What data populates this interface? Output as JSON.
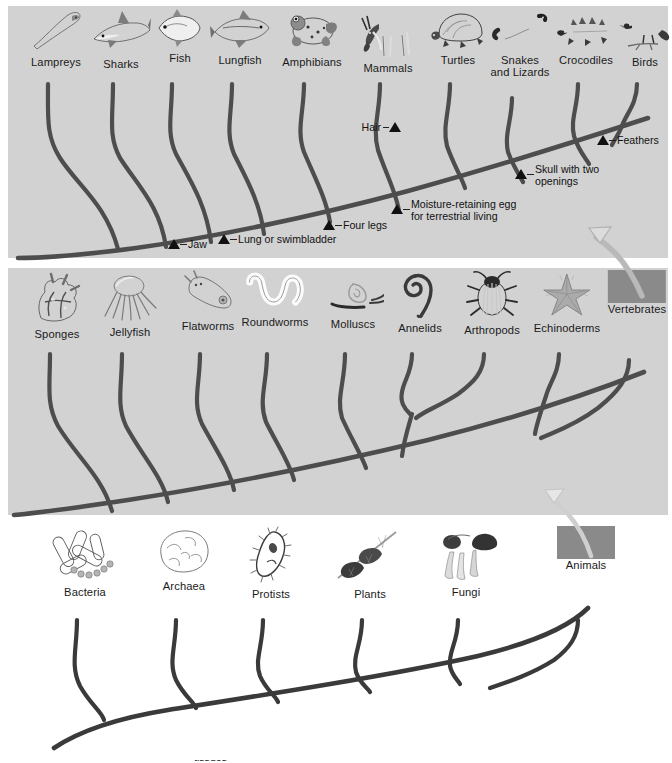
{
  "figure": {
    "colors": {
      "panel_background": "#d2d2d2",
      "page_background": "#ffffff",
      "branch": "#4d4d4d",
      "branch_dark": "#3a3a3a",
      "marker": "#111111",
      "text": "#1a1a1a",
      "placeholder_box": "#8a8a8a",
      "arrow_fill": "#d9d9d9",
      "arrow_stroke": "#9a9a9a"
    }
  },
  "panels": [
    {
      "id": "vertebrates-panel",
      "name": "vertebrate-phylogeny",
      "background": "#d2d2d2",
      "taxa": [
        {
          "label": "Lampreys",
          "icon": "lamprey-icon",
          "x": 48,
          "two_line": false
        },
        {
          "label": "Sharks",
          "icon": "shark-icon",
          "x": 113,
          "two_line": false
        },
        {
          "label": "Fish",
          "icon": "fish-icon",
          "x": 172,
          "two_line": false
        },
        {
          "label": "Lungfish",
          "icon": "lungfish-icon",
          "x": 232,
          "two_line": false
        },
        {
          "label": "Amphibians",
          "icon": "frog-icon",
          "x": 304,
          "two_line": false
        },
        {
          "label": "Mammals",
          "icon": "antelope-icon",
          "x": 380,
          "two_line": false
        },
        {
          "label": "Turtles",
          "icon": "turtle-icon",
          "x": 450,
          "two_line": false
        },
        {
          "label": "Snakes\nand Lizards",
          "icon": "snake-icon",
          "x": 512,
          "two_line": true
        },
        {
          "label": "Crocodiles",
          "icon": "crocodile-icon",
          "x": 578,
          "two_line": false
        },
        {
          "label": "Birds",
          "icon": "bird-icon",
          "x": 637,
          "two_line": false
        }
      ],
      "annotations": [
        {
          "label": "Jaw",
          "marker_x": 166,
          "marker_y": 243,
          "text_x": 180,
          "text_y": 243,
          "side": "right",
          "wrap": false,
          "width": 0
        },
        {
          "label": "Lung or swimbladder",
          "marker_x": 216,
          "marker_y": 238,
          "text_x": 230,
          "text_y": 238,
          "side": "right",
          "wrap": false,
          "width": 0
        },
        {
          "label": "Four legs",
          "marker_x": 321,
          "marker_y": 224,
          "text_x": 335,
          "text_y": 224,
          "side": "right",
          "wrap": false,
          "width": 0
        },
        {
          "label": "Moisture-retaining egg\nfor terrestrial living",
          "marker_x": 389,
          "marker_y": 208,
          "text_x": 403,
          "text_y": 202,
          "side": "right",
          "wrap": true,
          "width": 150
        },
        {
          "label": "Skull with two\nopenings",
          "marker_x": 513,
          "marker_y": 173,
          "text_x": 527,
          "text_y": 167,
          "side": "right",
          "wrap": true,
          "width": 110
        },
        {
          "label": "Feathers",
          "marker_x": 595,
          "marker_y": 139,
          "text_x": 609,
          "text_y": 139,
          "side": "right",
          "wrap": false,
          "width": 0
        },
        {
          "label": "Hair",
          "marker_x": 387,
          "marker_y": 126,
          "text_x": 373,
          "text_y": 126,
          "side": "left",
          "wrap": false,
          "width": 0
        }
      ]
    },
    {
      "id": "animals-panel",
      "name": "animal-phylogeny",
      "background": "#d2d2d2",
      "taxa": [
        {
          "label": "Sponges",
          "icon": "sponge-icon",
          "x": 49,
          "two_line": false
        },
        {
          "label": "Jellyfish",
          "icon": "jellyfish-icon",
          "x": 122,
          "two_line": false
        },
        {
          "label": "Flatworms",
          "icon": "flatworm-icon",
          "x": 200,
          "two_line": false
        },
        {
          "label": "Roundworms",
          "icon": "roundworm-icon",
          "x": 267,
          "two_line": false
        },
        {
          "label": "Molluscs",
          "icon": "snail-icon",
          "x": 345,
          "two_line": false
        },
        {
          "label": "Annelids",
          "icon": "annelid-icon",
          "x": 412,
          "two_line": false
        },
        {
          "label": "Arthropods",
          "icon": "beetle-icon",
          "x": 484,
          "two_line": false
        },
        {
          "label": "Echinoderms",
          "icon": "starfish-icon",
          "x": 559,
          "two_line": false
        },
        {
          "label": "Vertebrates",
          "icon": "placeholder-box",
          "x": 629,
          "two_line": false
        }
      ],
      "annotations": [
        {
          "label": "True\ntissues",
          "marker_x": 172,
          "marker_y": 487,
          "text_x": 186,
          "text_y": 481,
          "side": "right",
          "wrap": true,
          "width": 48
        },
        {
          "label": "Bilateral symmetry",
          "marker_x": 246,
          "marker_y": 478,
          "text_x": 260,
          "text_y": 478,
          "side": "right",
          "wrap": false,
          "width": 0
        },
        {
          "label": "True body\ncavity",
          "marker_x": 367,
          "marker_y": 465,
          "text_x": 381,
          "text_y": 459,
          "side": "right",
          "wrap": true,
          "width": 64
        },
        {
          "label": "Body cavity forms from\ndigestive tube",
          "marker_x": 449,
          "marker_y": 455,
          "text_x": 463,
          "text_y": 449,
          "side": "right",
          "wrap": true,
          "width": 160
        },
        {
          "label": "Backbone",
          "marker_x": 575,
          "marker_y": 413,
          "text_x": 589,
          "text_y": 413,
          "side": "right",
          "wrap": false,
          "width": 0
        }
      ]
    },
    {
      "id": "domains-panel",
      "name": "domains-of-life-phylogeny",
      "background": "#ffffff",
      "taxa": [
        {
          "label": "Bacteria",
          "icon": "bacteria-icon",
          "x": 77,
          "two_line": false
        },
        {
          "label": "Archaea",
          "icon": "archaea-icon",
          "x": 176,
          "two_line": false
        },
        {
          "label": "Protists",
          "icon": "protist-icon",
          "x": 263,
          "two_line": false
        },
        {
          "label": "Plants",
          "icon": "plant-icon",
          "x": 362,
          "two_line": false
        },
        {
          "label": "Fungi",
          "icon": "fungi-icon",
          "x": 458,
          "two_line": false
        },
        {
          "label": "Animals",
          "icon": "placeholder-box",
          "x": 578,
          "two_line": false
        }
      ],
      "annotations": []
    }
  ],
  "connectors": [
    {
      "name": "vertebrates-to-panel-1-arrow",
      "from_label": "Vertebrates",
      "to_panel": "vertebrates-panel"
    },
    {
      "name": "animals-to-panel-2-arrow",
      "from_label": "Animals",
      "to_panel": "animals-panel"
    }
  ]
}
